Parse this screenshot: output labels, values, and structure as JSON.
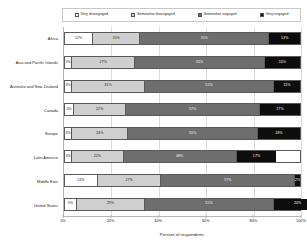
{
  "chart_data": {
    "type": "bar",
    "orientation": "horizontal",
    "stacked": true,
    "stack_mode": "percent",
    "title": "",
    "xlabel": "Percent of respondents",
    "ylabel": "",
    "xlim": [
      0,
      100
    ],
    "xticks": [
      0,
      20,
      40,
      60,
      80,
      100
    ],
    "xtick_labels": [
      "0%",
      "20%",
      "40%",
      "60%",
      "80%",
      "100%"
    ],
    "grid": true,
    "grid_axis": "x",
    "legend_position": "top",
    "categories": [
      "Africa",
      "Asia and Pacific Islands",
      "Australia and New Zealand",
      "Canada",
      "Europe",
      "Latin America",
      "Middle East",
      "United States"
    ],
    "series": [
      {
        "name": "Very disengaged",
        "color": "#ffffff",
        "label_color": "#222222",
        "values": [
          12,
          3,
          3,
          4,
          3,
          3,
          14,
          5
        ],
        "value_labels": [
          "12%",
          "3%",
          "3%",
          "4%",
          "3%",
          "3%",
          "14%",
          "5%"
        ]
      },
      {
        "name": "Somewhat disengaged",
        "color": "#cfcfcf",
        "label_color": "#222222",
        "values": [
          20,
          27,
          31,
          22,
          24,
          22,
          27,
          29
        ],
        "value_labels": [
          "20%",
          "27%",
          "31%",
          "22%",
          "24%",
          "22%",
          "27%",
          "29%"
        ]
      },
      {
        "name": "Somewhat engaged",
        "color": "#6e6e6e",
        "label_color": "#f2f2f2",
        "values": [
          55,
          55,
          55,
          57,
          55,
          48,
          57,
          55
        ],
        "value_labels": [
          "55%",
          "55%",
          "55%",
          "57%",
          "55%",
          "48%",
          "57%",
          "55%"
        ]
      },
      {
        "name": "Very engaged",
        "color": "#0d0d0d",
        "label_color": "#f7f7f7",
        "values": [
          13,
          15,
          11,
          17,
          18,
          17,
          2,
          20
        ],
        "value_labels": [
          "13%",
          "15%",
          "11%",
          "17%",
          "18%",
          "17%",
          "2%",
          "20%"
        ]
      }
    ]
  },
  "legend": {
    "items": [
      {
        "label": "Very disengaged",
        "color": "#ffffff"
      },
      {
        "label": "Somewhat disengaged",
        "color": "#cfcfcf"
      },
      {
        "label": "Somewhat engaged",
        "color": "#6e6e6e"
      },
      {
        "label": "Very engaged",
        "color": "#0d0d0d"
      }
    ]
  },
  "axis": {
    "x_title": "Percent of respondents",
    "x_tick_labels": [
      "0%",
      "20%",
      "40%",
      "60%",
      "80%",
      "100%"
    ]
  }
}
